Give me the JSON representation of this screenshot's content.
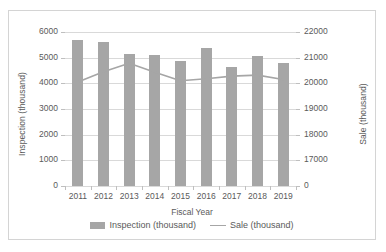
{
  "chart_data": {
    "type": "bar",
    "title": "",
    "subtitle": "",
    "xlabel": "Fiscal Year",
    "ylabel": "Inspection (thousand)",
    "y2label": "Sale (thousand)",
    "grid": true,
    "legend_position": "bottom",
    "categories": [
      "2011",
      "2012",
      "2013",
      "2014",
      "2015",
      "2016",
      "2017",
      "2018",
      "2019"
    ],
    "ylim": [
      0,
      6000
    ],
    "yticks": [
      "0",
      "1000",
      "2000",
      "3000",
      "4000",
      "5000",
      "6000"
    ],
    "y2lim": [
      16000,
      22000
    ],
    "y2ticks": [
      "0",
      "17000",
      "18000",
      "19000",
      "20000",
      "21000",
      "22000"
    ],
    "series": [
      {
        "name": "Inspection (thousand)",
        "type": "bar",
        "axis": "left",
        "color": "#a6a6a6",
        "values": [
          5680,
          5620,
          5130,
          5120,
          4870,
          5360,
          4620,
          5050,
          4800
        ]
      },
      {
        "name": "Sale (thousand)",
        "type": "line",
        "axis": "right",
        "color": "#a6a6a6",
        "values": [
          20050,
          20450,
          20780,
          20430,
          20100,
          20180,
          20280,
          20320,
          20150
        ]
      }
    ]
  },
  "legend": [
    {
      "label": "Inspection (thousand)",
      "marker": "bar-swatch-icon"
    },
    {
      "label": "Sale (thousand)",
      "marker": "line-swatch-icon"
    }
  ]
}
